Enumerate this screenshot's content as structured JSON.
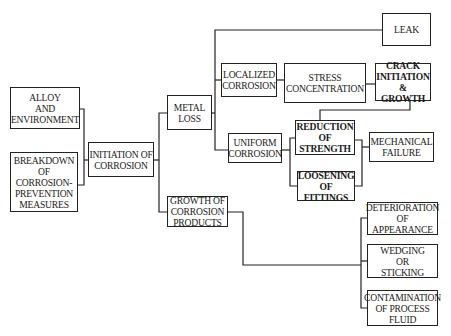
{
  "diagram": {
    "type": "flowchart",
    "nodes": {
      "alloy": "ALLOY\nAND\nENVIRONMENT",
      "breakdown": "BREAKDOWN\nOF\nCORROSION-\nPREVENTION\nMEASURES",
      "initiation": "INITIATION OF\nCORROSION",
      "metal_loss": "METAL\nLOSS",
      "growth": "GROWTH OF\nCORROSION\nPRODUCTS",
      "localized": "LOCALIZED\nCORROSION",
      "stress": "STRESS\nCONCENTRATION",
      "crack": "CRACK\nINITIATION\n& GROWTH",
      "leak": "LEAK",
      "uniform": "UNIFORM\nCORROSION",
      "reduction": "REDUCTION\nOF\nSTRENGTH",
      "mechanical": "MECHANICAL\nFAILURE",
      "loosening": "LOOSENING\nOF\nFITTINGS",
      "deterioration": "DETERIORATION\nOF\nAPPEARANCE",
      "wedging": "WEDGING\nOR\nSTICKING",
      "contamination": "CONTAMINATION\nOF PROCESS\nFLUID"
    },
    "edges": [
      [
        "alloy",
        "initiation"
      ],
      [
        "breakdown",
        "initiation"
      ],
      [
        "initiation",
        "metal_loss"
      ],
      [
        "initiation",
        "growth"
      ],
      [
        "metal_loss",
        "leak"
      ],
      [
        "metal_loss",
        "localized"
      ],
      [
        "metal_loss",
        "uniform"
      ],
      [
        "localized",
        "stress"
      ],
      [
        "stress",
        "crack"
      ],
      [
        "crack",
        "reduction"
      ],
      [
        "uniform",
        "reduction"
      ],
      [
        "uniform",
        "loosening"
      ],
      [
        "reduction",
        "mechanical"
      ],
      [
        "loosening",
        "mechanical"
      ],
      [
        "growth",
        "deterioration"
      ],
      [
        "growth",
        "wedging"
      ],
      [
        "growth",
        "contamination"
      ]
    ]
  }
}
